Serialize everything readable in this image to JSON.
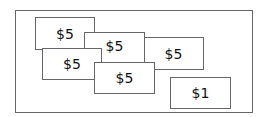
{
  "bills": [
    {
      "label": "$5",
      "left": 35,
      "top": 17,
      "width": 60,
      "height": 33,
      "z": 1
    },
    {
      "label": "$5",
      "left": 143,
      "top": 37,
      "width": 61,
      "height": 33,
      "z": 1
    },
    {
      "label": "$5",
      "left": 84,
      "top": 32,
      "width": 61,
      "height": 31,
      "z": 2
    },
    {
      "label": "$5",
      "left": 42,
      "top": 48,
      "width": 60,
      "height": 32,
      "z": 3
    },
    {
      "label": "$5",
      "left": 94,
      "top": 62,
      "width": 61,
      "height": 32,
      "z": 4
    },
    {
      "label": "$1",
      "left": 170,
      "top": 77,
      "width": 61,
      "height": 32,
      "z": 1
    }
  ]
}
